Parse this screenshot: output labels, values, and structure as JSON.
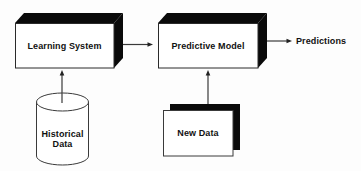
{
  "diagram": {
    "background_color": "#fdfdfd",
    "shape_fill": "#ffffff",
    "shadow_fill": "#0a0a0a",
    "stroke_color": "#2a2a2a",
    "text_color": "#111111",
    "nodes": {
      "learning_system": {
        "label": "Learning System",
        "shape": "3d-box"
      },
      "predictive_model": {
        "label": "Predictive Model",
        "shape": "3d-box"
      },
      "historical_data": {
        "label": "Historical Data",
        "shape": "database-cylinder"
      },
      "new_data": {
        "label": "New Data",
        "shape": "document-stack"
      },
      "predictions": {
        "label": "Predictions",
        "shape": "text-output"
      }
    },
    "edges": [
      {
        "from": "learning_system",
        "to": "predictive_model",
        "direction": "right"
      },
      {
        "from": "historical_data",
        "to": "learning_system",
        "direction": "up"
      },
      {
        "from": "new_data",
        "to": "predictive_model",
        "direction": "up"
      },
      {
        "from": "predictive_model",
        "to": "predictions",
        "direction": "right"
      }
    ]
  }
}
